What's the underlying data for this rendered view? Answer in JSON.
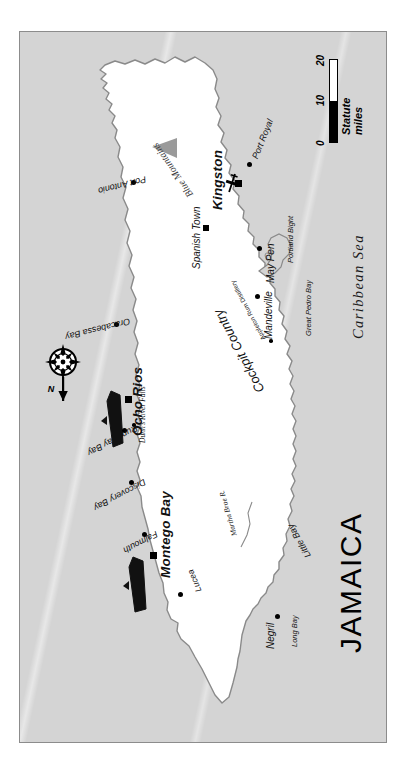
{
  "map": {
    "title": "JAMAICA",
    "sea_label": "Caribbean Sea",
    "colors": {
      "sea": "#d4d4d4",
      "land": "#ffffff",
      "coastline": "#8a8a8a",
      "frame": "#8c8c8c",
      "ink": "#111111",
      "mountain": "#9a9a9a"
    },
    "scale": {
      "ticks": [
        "0",
        "10",
        "20"
      ],
      "caption": "Statute miles"
    },
    "compass": {
      "label": "N",
      "icon": "compass-rose-icon"
    },
    "cities": [
      {
        "name": "Kingston",
        "rank": "capital",
        "marker": "square"
      },
      {
        "name": "Montego Bay",
        "rank": "major",
        "marker": "square"
      },
      {
        "name": "Ocho Rios",
        "rank": "major",
        "marker": "square"
      },
      {
        "name": "Spanish Town",
        "rank": "mid",
        "marker": "square-small"
      },
      {
        "name": "Mandeville",
        "rank": "mid",
        "marker": "dot"
      },
      {
        "name": "May Pen",
        "rank": "mid",
        "marker": "dot"
      },
      {
        "name": "Negril",
        "rank": "mid",
        "marker": "dot"
      },
      {
        "name": "Lucea",
        "rank": "small",
        "marker": "dot"
      },
      {
        "name": "Falmouth",
        "rank": "small",
        "marker": "dot"
      },
      {
        "name": "Discovery Bay",
        "rank": "small",
        "marker": "dot"
      },
      {
        "name": "Runaway Bay",
        "rank": "small",
        "marker": "dot"
      },
      {
        "name": "Oracabessa Bay",
        "rank": "small",
        "marker": "dot"
      },
      {
        "name": "Port Antonio",
        "rank": "small",
        "marker": "dot"
      },
      {
        "name": "Port Royal",
        "rank": "small",
        "marker": "dot"
      }
    ],
    "regions": [
      {
        "name": "Cockpit Country"
      },
      {
        "name": "Blue Mountains"
      }
    ],
    "water_features": [
      {
        "name": "Long Bay"
      },
      {
        "name": "Little Bay"
      },
      {
        "name": "Great Pedro Bay"
      },
      {
        "name": "Portland Bight"
      },
      {
        "name": "Martha Brae R."
      }
    ],
    "points_of_interest": [
      {
        "name": "Appleton Rum Distillery",
        "marker": "dot"
      },
      {
        "name": "Dunn's River Falls",
        "marker": "dot"
      }
    ],
    "icons": [
      {
        "name": "cruise-ship-ocho-rios"
      },
      {
        "name": "cruise-ship-montego-bay"
      },
      {
        "name": "airport-kingston"
      },
      {
        "name": "mountain-peak-blue-mountains"
      }
    ]
  }
}
